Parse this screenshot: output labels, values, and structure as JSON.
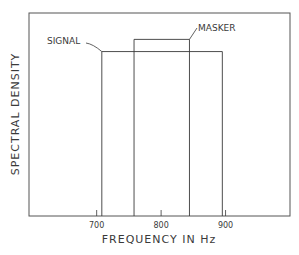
{
  "chart_data": {
    "type": "bar",
    "title": "",
    "xlabel": "FREQUENCY IN Hz",
    "ylabel": "SPECTRAL DENSITY",
    "x_ticks": [
      {
        "value": 700,
        "label": "700"
      },
      {
        "value": 800,
        "label": "800"
      },
      {
        "value": 900,
        "label": "900"
      }
    ],
    "xlim": [
      595,
      1000
    ],
    "ylim": [
      0,
      1
    ],
    "grid": false,
    "series": [
      {
        "name": "SIGNAL",
        "x_start": 708,
        "x_end": 895,
        "level": 0.81
      },
      {
        "name": "MASKER",
        "x_start": 758,
        "x_end": 844,
        "level": 0.87
      }
    ],
    "annotations": [
      {
        "text": "SIGNAL",
        "points_to": "SIGNAL"
      },
      {
        "text": "MASKER",
        "points_to": "MASKER"
      }
    ]
  },
  "colors": {
    "ink": "#3a3a3a",
    "frame": "#555555",
    "background": "#ffffff"
  }
}
